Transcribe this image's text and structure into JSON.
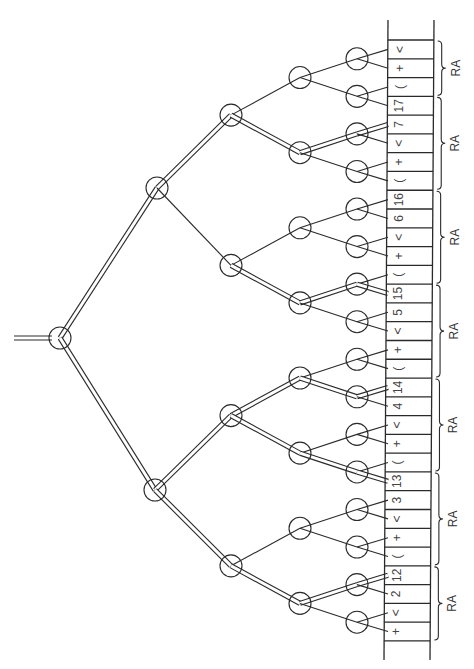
{
  "diagram": {
    "type": "binary-tree-over-symbol-strip",
    "orientation": "rotated-90 (root at left, leaves at right)",
    "colors": {
      "ink": "#2a2a2a",
      "cell_text": "#444444",
      "background": "#ffffff"
    },
    "strip": {
      "x_left": 388,
      "x_right": 434,
      "y_top": 20,
      "y_bottom": 660,
      "cells_y_start": 40,
      "cell_height": 18.78,
      "cells_top_to_bottom": [
        "<",
        "+",
        "(",
        "17",
        "7",
        "<",
        "+",
        "(",
        "16",
        "6",
        "<",
        "+",
        "(",
        "15",
        "5",
        "<",
        "+",
        "(",
        "14",
        "4",
        "<",
        "+",
        "(",
        "13",
        "3",
        "<",
        "+",
        "(",
        "12",
        "2",
        "<",
        "+"
      ],
      "sequence_bottom_to_top": "+ < 2 12 ( + < 3 13 ( + < 4 14 ( + < 5 15 ( + < 6 16 ( + < 7 17 ( + <"
    },
    "tree": {
      "node_radius": 11,
      "root": {
        "x": 60,
        "y": 338
      },
      "input_line": {
        "x1": 14,
        "x2": 50
      },
      "level_x": [
        60,
        157,
        231,
        300,
        357
      ],
      "double_edges": [
        "root-L1_0",
        "root-L1_1",
        "L1_0-L2_0",
        "L2_0-L3_1",
        "L3_1-LF_2",
        "LF_2-C_4",
        "L2_1-L3_3",
        "L3_3-LF_6",
        "LF_6-C_13",
        "L1_1-L2_2",
        "L2_2-L3_4",
        "L3_4-LF_9",
        "LF_9-C_18",
        "L2_2-L3_5",
        "L3_5-LF_11",
        "LF_11-C_23",
        "L1_1-L2_3",
        "L2_3-L3_7",
        "L3_7-LF_14",
        "LF_14-C_28"
      ]
    },
    "braces": {
      "label": "RA",
      "x": 438,
      "groups_cell_ranges": [
        [
          0,
          3
        ],
        [
          3,
          8
        ],
        [
          8,
          13
        ],
        [
          13,
          18
        ],
        [
          18,
          23
        ],
        [
          23,
          28
        ],
        [
          28,
          32
        ]
      ]
    }
  }
}
